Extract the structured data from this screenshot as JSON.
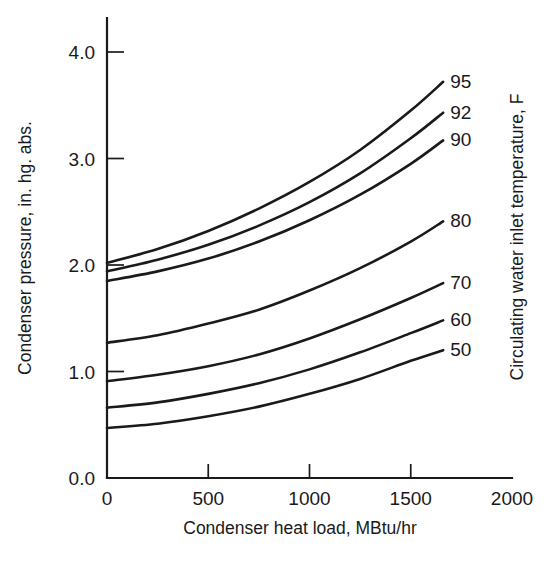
{
  "chart_data": {
    "type": "line",
    "title": "",
    "xlabel": "Condenser heat load, MBtu/hr",
    "ylabel": "Condenser pressure, in. hg. abs.",
    "y2label": "Circulating water inlet temperature, F",
    "xlim": [
      0,
      2000
    ],
    "ylim": [
      0.0,
      4.0
    ],
    "xticks": [
      0,
      500,
      1000,
      1500,
      2000
    ],
    "xticklabels": [
      "0",
      "500",
      "1000",
      "1500",
      "2000"
    ],
    "yticks": [
      0.0,
      1.0,
      2.0,
      3.0,
      4.0
    ],
    "yticklabels": [
      "0.0",
      "1.0",
      "2.0",
      "3.0",
      "4.0"
    ],
    "grid": false,
    "legend_position": "right-of-curve-ends",
    "x": [
      0,
      250,
      500,
      750,
      1000,
      1250,
      1500,
      1660
    ],
    "series": [
      {
        "name": "95",
        "label": "95",
        "values": [
          2.02,
          2.15,
          2.32,
          2.53,
          2.78,
          3.08,
          3.45,
          3.72
        ]
      },
      {
        "name": "92",
        "label": "92",
        "values": [
          1.94,
          2.05,
          2.19,
          2.37,
          2.59,
          2.86,
          3.19,
          3.43
        ]
      },
      {
        "name": "90",
        "label": "90",
        "values": [
          1.85,
          1.94,
          2.06,
          2.22,
          2.42,
          2.66,
          2.95,
          3.17
        ]
      },
      {
        "name": "80",
        "label": "80",
        "values": [
          1.27,
          1.34,
          1.45,
          1.58,
          1.76,
          1.97,
          2.22,
          2.41
        ]
      },
      {
        "name": "70",
        "label": "70",
        "values": [
          0.91,
          0.97,
          1.05,
          1.16,
          1.31,
          1.49,
          1.69,
          1.83
        ]
      },
      {
        "name": "60",
        "label": "60",
        "values": [
          0.66,
          0.71,
          0.79,
          0.89,
          1.02,
          1.18,
          1.36,
          1.48
        ]
      },
      {
        "name": "50",
        "label": "50",
        "values": [
          0.47,
          0.51,
          0.58,
          0.67,
          0.79,
          0.93,
          1.1,
          1.2
        ]
      }
    ]
  }
}
